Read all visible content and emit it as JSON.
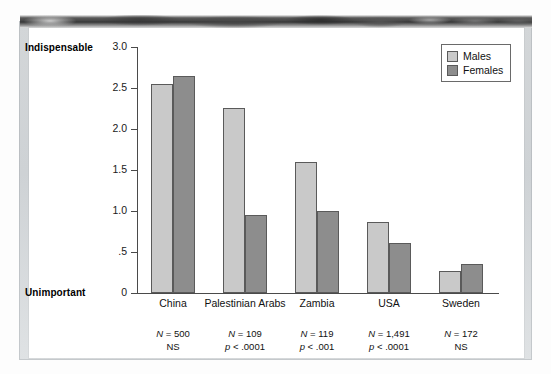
{
  "chart_data": {
    "type": "bar",
    "title": "",
    "xlabel": "",
    "ylabel": "",
    "ylim": [
      0,
      3.0
    ],
    "grid": false,
    "legend_position": "top-right",
    "axis_top_label": "Indispensable",
    "axis_bottom_label": "Unimportant",
    "ytick_labels": [
      "3.0",
      "2.5",
      "2.0",
      "1.5",
      "1.0",
      ".5",
      "0"
    ],
    "ytick_values": [
      3.0,
      2.5,
      2.0,
      1.5,
      1.0,
      0.5,
      0
    ],
    "categories": [
      "China",
      "Palestinian Arabs",
      "Zambia",
      "USA",
      "Sweden"
    ],
    "series": [
      {
        "name": "Males",
        "color": "#c9c9c9",
        "values": [
          2.55,
          2.26,
          1.6,
          0.86,
          0.27
        ]
      },
      {
        "name": "Females",
        "color": "#8d8d8d",
        "values": [
          2.65,
          0.95,
          1.0,
          0.61,
          0.35
        ]
      }
    ],
    "annotations": [
      {
        "category": "China",
        "n": "N = 500",
        "sig": "NS"
      },
      {
        "category": "Palestinian Arabs",
        "n": "N = 109",
        "sig": "p < .0001"
      },
      {
        "category": "Zambia",
        "n": "N = 119",
        "sig": "p < .001"
      },
      {
        "category": "USA",
        "n": "N = 1,491",
        "sig": "p < .0001"
      },
      {
        "category": "Sweden",
        "n": "N = 172",
        "sig": "NS"
      }
    ]
  },
  "legend": {
    "items": [
      {
        "label": "Males"
      },
      {
        "label": "Females"
      }
    ]
  }
}
